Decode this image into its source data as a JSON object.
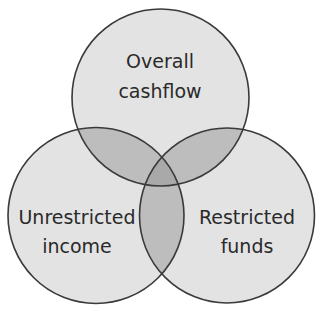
{
  "diagram": {
    "type": "venn",
    "sets": [
      {
        "id": "top",
        "line1": "Overall",
        "line2": "cashflow"
      },
      {
        "id": "left",
        "line1": "Unrestricted",
        "line2": "income"
      },
      {
        "id": "right",
        "line1": "Restricted",
        "line2": "funds"
      }
    ],
    "colors": {
      "fill": "#e3e3e3",
      "overlap": "#bdbdbd",
      "center": "#a9a9a9",
      "stroke": "#3a3a3a"
    }
  }
}
